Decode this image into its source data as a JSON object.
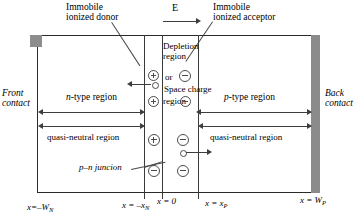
{
  "figure": {
    "title_top_left": "Immobile\nionized donor",
    "top_left_line1": "Immobile",
    "top_left_line2": "ionized donor",
    "top_right_line1": "Immobile",
    "top_right_line2": "ionized acceptor",
    "field_label": "E"
  },
  "contacts": {
    "front_line1": "Front",
    "front_line2": "contact",
    "back_line1": "Back",
    "back_line2": "contact"
  },
  "regions": {
    "n_type": "n-type region",
    "p_type": "p-type region",
    "depletion_line1": "Depletion",
    "depletion_line2": "region",
    "depletion_or": "or",
    "depletion_line3": "Space charge",
    "depletion_line4": "region",
    "quasi_neutral_left": "quasi-neutral region",
    "quasi_neutral_right": "quasi-neutral region",
    "junction_label": "p–n juncion"
  },
  "axis": {
    "x_minus_WN": "x=–W",
    "x_minus_WN_sub": "N",
    "x_minus_xN_pre": "x = –x",
    "x_minus_xN_sub": "N",
    "x_zero": "x = 0",
    "x_xP_pre": "x = x",
    "x_xP_sub": "P",
    "x_WP_pre": "x = W",
    "x_WP_sub": "P"
  },
  "charges": {
    "plus": "⊕",
    "minus": "⊖"
  },
  "colors": {
    "ink": "#2b2b2b",
    "line": "#3d3d3d",
    "contact_gray": "#8b8b8b",
    "paper": "#ffffff"
  }
}
